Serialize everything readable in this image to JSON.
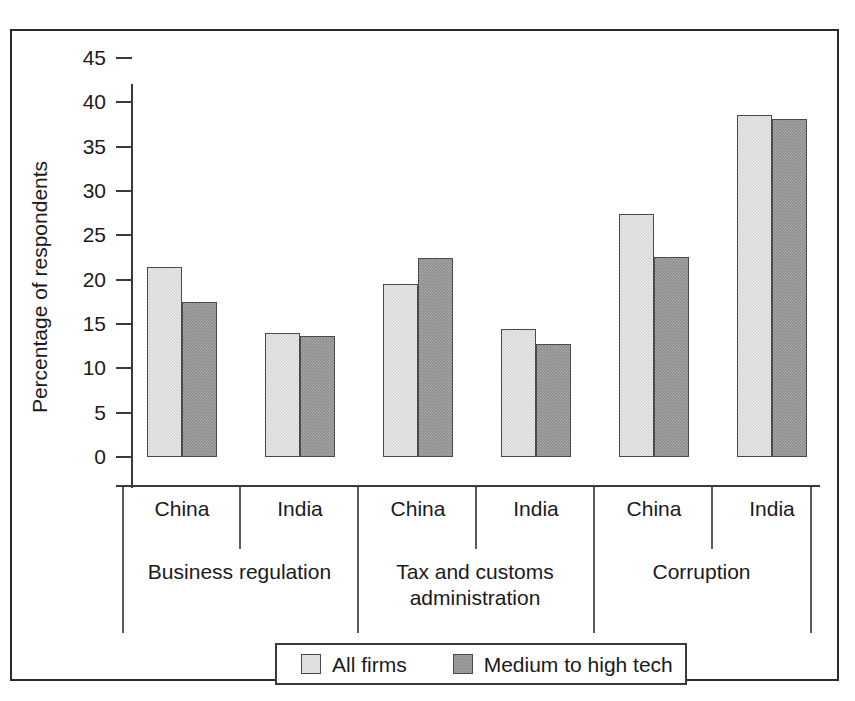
{
  "chart_data": {
    "type": "bar",
    "title": "",
    "subtitle": "",
    "xlabel": "",
    "ylabel": "Percentage of respondents",
    "ylim": [
      0,
      45
    ],
    "yticks": [
      0,
      5,
      10,
      15,
      20,
      25,
      30,
      35,
      40,
      45
    ],
    "ytick_labels": [
      "0",
      "5",
      "10",
      "15",
      "20",
      "25",
      "30",
      "35",
      "40",
      "45"
    ],
    "grid": false,
    "legend_position": "bottom",
    "categories": [
      "China",
      "India",
      "China",
      "India",
      "China",
      "India"
    ],
    "group_labels": [
      "Business regulation",
      "Tax and customs administration",
      "Corruption"
    ],
    "series": [
      {
        "name": "All firms",
        "color": "#d6d6d6",
        "values": [
          21.4,
          14.0,
          19.5,
          14.4,
          27.4,
          38.6
        ]
      },
      {
        "name": "Medium to high tech",
        "color": "#8b8b8b",
        "values": [
          17.5,
          13.7,
          22.5,
          12.8,
          22.6,
          38.1
        ]
      }
    ],
    "groups": [
      {
        "label": "Business regulation",
        "countries": [
          {
            "name": "China",
            "all_firms": 21.4,
            "medium_to_high_tech": 17.5
          },
          {
            "name": "India",
            "all_firms": 14.0,
            "medium_to_high_tech": 13.7
          }
        ]
      },
      {
        "label": "Tax and customs administration",
        "label_line1": "Tax and customs",
        "label_line2": "administration",
        "countries": [
          {
            "name": "China",
            "all_firms": 19.5,
            "medium_to_high_tech": 22.5
          },
          {
            "name": "India",
            "all_firms": 14.4,
            "medium_to_high_tech": 12.8
          }
        ]
      },
      {
        "label": "Corruption",
        "countries": [
          {
            "name": "China",
            "all_firms": 27.4,
            "medium_to_high_tech": 22.6
          },
          {
            "name": "India",
            "all_firms": 38.6,
            "medium_to_high_tech": 38.1
          }
        ]
      }
    ]
  },
  "axis": {
    "y_title": "Percentage of respondents",
    "y_labels": [
      "45",
      "40",
      "35",
      "30",
      "25",
      "20",
      "15",
      "10",
      "5",
      "0"
    ]
  },
  "x_axis": {
    "category_labels": [
      "China",
      "India",
      "China",
      "India",
      "China",
      "India"
    ],
    "group_label_0": "Business regulation",
    "group_label_1_line1": "Tax and customs",
    "group_label_1_line2": "administration",
    "group_label_2": "Corruption"
  },
  "legend": {
    "items": [
      {
        "label": "All firms",
        "color": "#d6d6d6"
      },
      {
        "label": "Medium to high tech",
        "color": "#8b8b8b"
      }
    ]
  },
  "colors": {
    "light_bar": "#d6d6d6",
    "dark_bar": "#8b8b8b",
    "bar_outline": "#4a4a4a",
    "axis": "#3a3a3a",
    "frame": "#2b2b2b",
    "background": "#ffffff"
  }
}
